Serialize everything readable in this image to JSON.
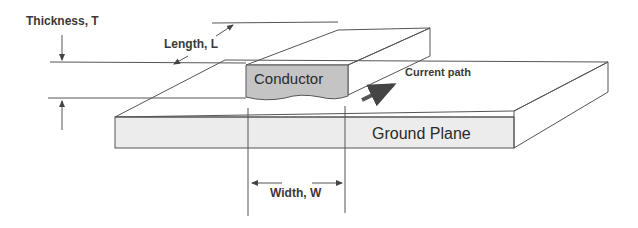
{
  "diagram": {
    "labels": {
      "thickness": "Thickness, T",
      "length": "Length, L",
      "conductor": "Conductor",
      "current_path": "Current path",
      "ground_plane": "Ground Plane",
      "width": "Width, W"
    },
    "colors": {
      "conductor_fill": "#c4c4c4",
      "ground_plane_front": "#ececec",
      "line": "#555555",
      "arrow": "#555555",
      "text": "#3a3a3a"
    }
  }
}
